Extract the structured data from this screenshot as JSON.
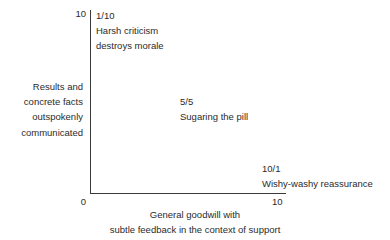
{
  "chart_data": {
    "type": "scatter",
    "title": "",
    "xlabel_lines": [
      "General goodwill with",
      "subtle feedback in the context of support"
    ],
    "ylabel_lines": [
      "Results and",
      "concrete facts",
      "outspokenly",
      "communicated"
    ],
    "xlim": [
      0,
      10
    ],
    "ylim": [
      0,
      10
    ],
    "x_ticks": [
      "0",
      "10"
    ],
    "y_ticks": [
      "10"
    ],
    "grid": false,
    "legend": "none",
    "points": [
      {
        "id": "harsh-criticism",
        "coord_label": "1/10",
        "x": 1,
        "y": 10,
        "desc_lines": [
          "Harsh criticism",
          "destroys morale"
        ]
      },
      {
        "id": "sugaring-the-pill",
        "coord_label": "5/5",
        "x": 5,
        "y": 5,
        "desc_lines": [
          "Sugaring the pill"
        ]
      },
      {
        "id": "wishy-washy-reassurance",
        "coord_label": "10/1",
        "x": 10,
        "y": 1,
        "desc_lines": [
          "Wishy-washy reassurance"
        ]
      }
    ]
  },
  "axes": {
    "y_tick_10": "10",
    "x_tick_0": "0",
    "x_tick_10": "10",
    "y_title": {
      "line1": "Results and",
      "line2": "concrete facts",
      "line3": "outspokenly",
      "line4": "communicated"
    },
    "x_title": {
      "line1": "General goodwill with",
      "line2": "subtle feedback in the context of support"
    }
  },
  "annotations": {
    "top_left": {
      "coord": "1/10",
      "line1": "Harsh criticism",
      "line2": "destroys morale"
    },
    "middle": {
      "coord": "5/5",
      "line1": "Sugaring the pill"
    },
    "bottom_right": {
      "coord": "10/1",
      "line1": "Wishy-washy reassurance"
    }
  },
  "colors": {
    "background": "#ffffff",
    "text": "#2b2b2b",
    "axis": "#3a3a3a"
  }
}
